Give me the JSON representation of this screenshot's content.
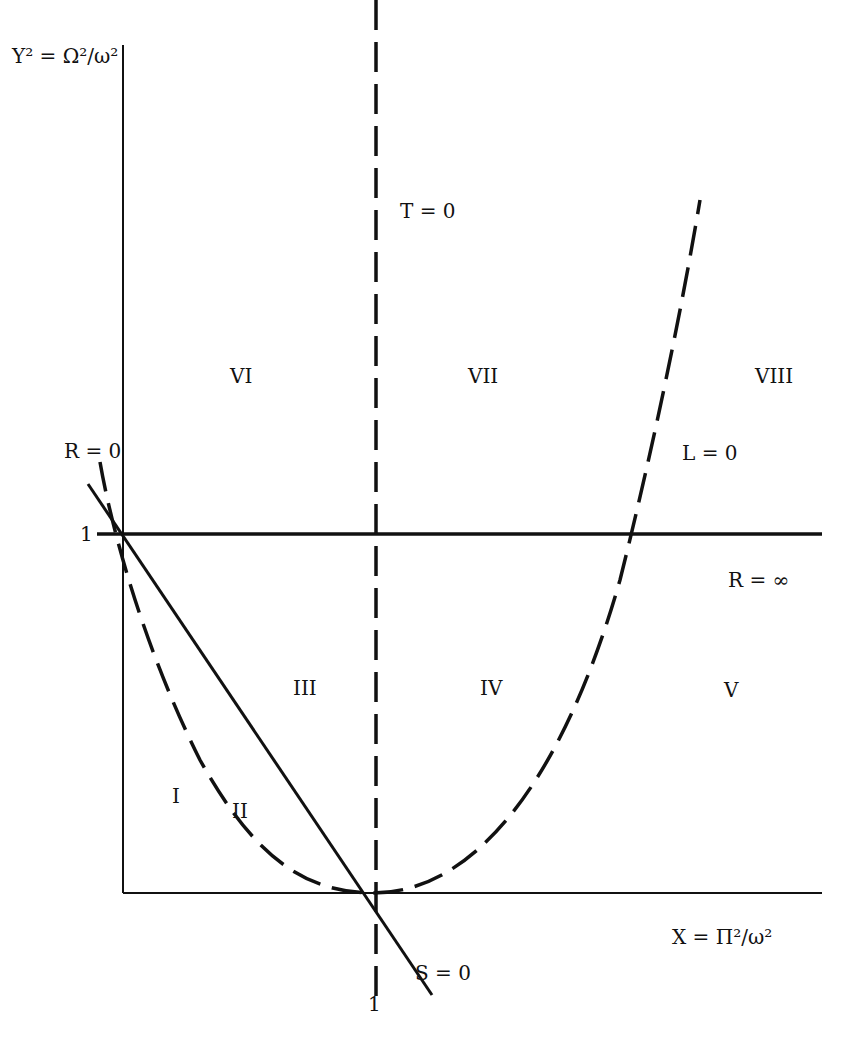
{
  "figure": {
    "axes": {
      "y_label": "Y² = Ω²/ω²",
      "x_label": "X = Π²/ω²",
      "y_tick": "1",
      "x_tick": "1"
    },
    "curves": {
      "T_zero": "T = 0",
      "R_zero": "R = 0",
      "L_zero": "L = 0",
      "S_zero": "S = 0",
      "R_inf": "R = ∞"
    },
    "regions": [
      "I",
      "II",
      "III",
      "IV",
      "V",
      "VI",
      "VII",
      "VIII"
    ],
    "colors": {
      "ink": "#111111",
      "background": "#ffffff"
    }
  }
}
